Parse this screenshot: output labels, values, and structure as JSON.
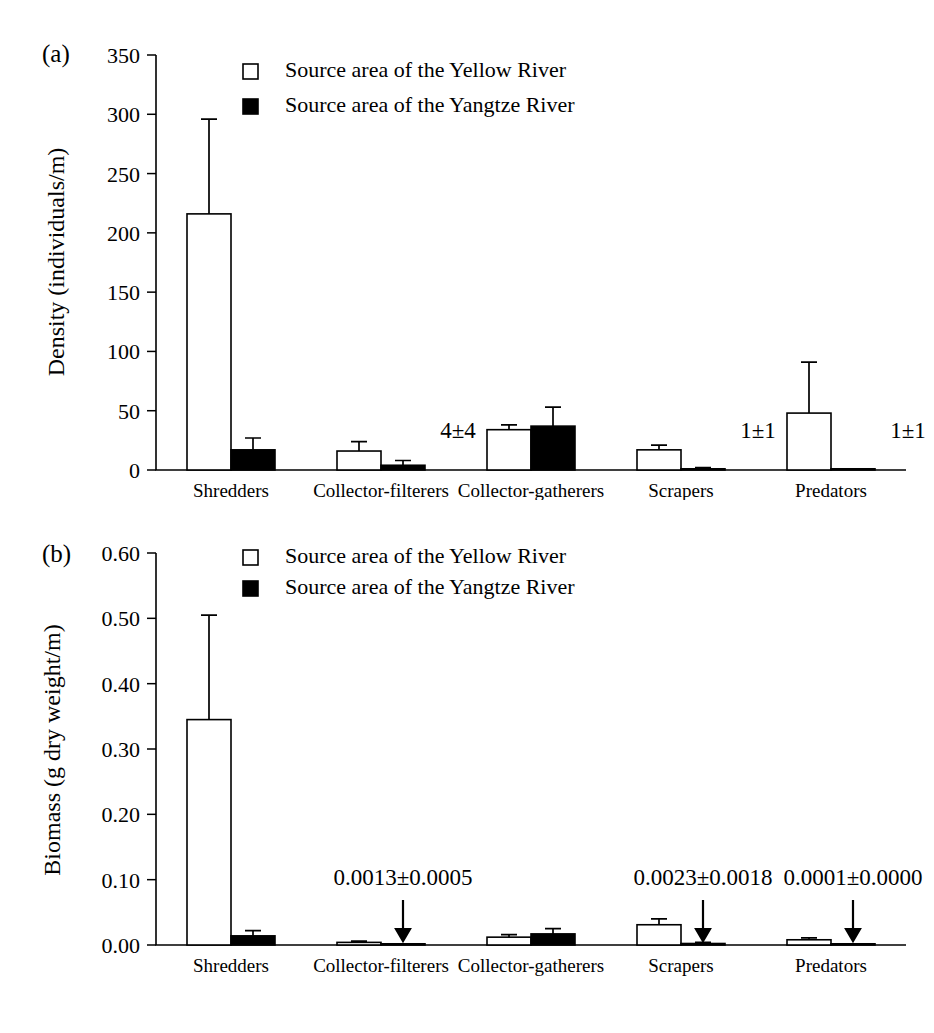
{
  "figure": {
    "background_color": "#ffffff",
    "ink_color": "#000000",
    "panel_a_label": "(a)",
    "panel_b_label": "(b)"
  },
  "legend": {
    "open_swatch_name": "open-square-swatch",
    "filled_swatch_name": "filled-square-swatch",
    "entries": [
      {
        "label": "Source area of the Yellow River",
        "style": "open",
        "color": "#ffffff"
      },
      {
        "label": "Source area of the Yangtze River",
        "style": "filled",
        "color": "#000000"
      }
    ]
  },
  "chart_data": [
    {
      "type": "bar",
      "panel": "(a)",
      "title": "",
      "xlabel": "",
      "ylabel": "Density (individuals/m)",
      "ylim": [
        0,
        350
      ],
      "yticks": [
        0,
        50,
        100,
        150,
        200,
        250,
        300,
        350
      ],
      "ytick_labels": [
        "0",
        "50",
        "100",
        "150",
        "200",
        "250",
        "300",
        "350"
      ],
      "grid": false,
      "legend_position": "top-left-inside",
      "categories": [
        "Shredders",
        "Collector-filterers",
        "Collector-gatherers",
        "Scrapers",
        "Predators"
      ],
      "series": [
        {
          "name": "Source area of the Yellow River",
          "style": "open",
          "values": [
            216,
            16,
            34,
            17,
            48
          ],
          "errors": [
            80,
            8,
            4,
            4,
            43
          ]
        },
        {
          "name": "Source area of the Yangtze River",
          "style": "filled",
          "values": [
            17,
            4,
            37,
            1,
            1
          ],
          "errors": [
            10,
            4,
            16,
            1,
            0
          ]
        }
      ],
      "annotations": [
        {
          "text": "4±4",
          "category": "Collector-filterers",
          "series": "Source area of the Yangtze River",
          "arrow": false
        },
        {
          "text": "1±1",
          "category": "Scrapers",
          "series": "Source area of the Yangtze River",
          "arrow": false
        },
        {
          "text": "1±1",
          "category": "Predators",
          "series": "Source area of the Yangtze River",
          "arrow": false
        }
      ]
    },
    {
      "type": "bar",
      "panel": "(b)",
      "title": "",
      "xlabel": "",
      "ylabel": "Biomass (g dry weight/m)",
      "ylim": [
        0.0,
        0.6
      ],
      "yticks": [
        0.0,
        0.1,
        0.2,
        0.3,
        0.4,
        0.5,
        0.6
      ],
      "ytick_labels": [
        "0.00",
        "0.10",
        "0.20",
        "0.30",
        "0.40",
        "0.50",
        "0.60"
      ],
      "grid": false,
      "legend_position": "top-left-inside",
      "categories": [
        "Shredders",
        "Collector-filterers",
        "Collector-gatherers",
        "Scrapers",
        "Predators"
      ],
      "series": [
        {
          "name": "Source area of the Yellow River",
          "style": "open",
          "values": [
            0.345,
            0.004,
            0.012,
            0.031,
            0.008
          ],
          "errors": [
            0.16,
            0.002,
            0.004,
            0.009,
            0.003
          ]
        },
        {
          "name": "Source area of the Yangtze River",
          "style": "filled",
          "values": [
            0.014,
            0.0013,
            0.017,
            0.0023,
            0.0001
          ],
          "errors": [
            0.008,
            0.0005,
            0.008,
            0.0018,
            0.0
          ]
        }
      ],
      "annotations": [
        {
          "text": "0.0013±0.0005",
          "category": "Collector-filterers",
          "series": "Source area of the Yangtze River",
          "arrow": true
        },
        {
          "text": "0.0023±0.0018",
          "category": "Scrapers",
          "series": "Source area of the Yangtze River",
          "arrow": true
        },
        {
          "text": "0.0001±0.0000",
          "category": "Predators",
          "series": "Source area of the Yangtze River",
          "arrow": true
        }
      ]
    }
  ]
}
